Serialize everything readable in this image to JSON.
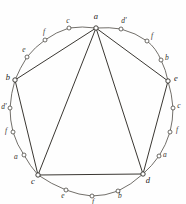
{
  "figure": {
    "type": "geometric-diagram",
    "width": 186,
    "height": 204,
    "background_color": "#fefefe",
    "ink_color": "#3a3732",
    "arc_color": "#59554f",
    "vertices": [
      {
        "id": "v-a",
        "label": "a",
        "x": 96,
        "y": 28,
        "label_x": 96,
        "label_y": 16
      },
      {
        "id": "v-e",
        "label": "e",
        "x": 168,
        "y": 81,
        "label_x": 176,
        "label_y": 78
      },
      {
        "id": "v-d",
        "label": "d",
        "x": 143,
        "y": 174,
        "label_x": 148,
        "label_y": 180
      },
      {
        "id": "v-c",
        "label": "c",
        "x": 38,
        "y": 175,
        "label_x": 33,
        "label_y": 181
      },
      {
        "id": "v-b",
        "label": "b",
        "x": 15,
        "y": 80,
        "label_x": 8,
        "label_y": 77
      }
    ],
    "arc_points": [
      {
        "id": "p-1",
        "label": "d'",
        "x": 121,
        "y": 29,
        "label_x": 124,
        "label_y": 21
      },
      {
        "id": "p-2",
        "label": "f",
        "x": 147,
        "y": 41,
        "label_x": 152,
        "label_y": 36
      },
      {
        "id": "p-3",
        "label": "b",
        "x": 161,
        "y": 60,
        "label_x": 167,
        "label_y": 58
      },
      {
        "id": "p-4",
        "label": "c",
        "x": 173,
        "y": 108,
        "label_x": 179,
        "label_y": 106
      },
      {
        "id": "p-5",
        "label": "f",
        "x": 170,
        "y": 132,
        "label_x": 177,
        "label_y": 130
      },
      {
        "id": "p-6",
        "label": "a",
        "x": 159,
        "y": 156,
        "label_x": 165,
        "label_y": 155
      },
      {
        "id": "p-7",
        "label": "b",
        "x": 118,
        "y": 191,
        "label_x": 120,
        "label_y": 196
      },
      {
        "id": "p-8",
        "label": "f",
        "x": 92,
        "y": 196,
        "label_x": 93,
        "label_y": 202
      },
      {
        "id": "p-9",
        "label": "e",
        "x": 66,
        "y": 190,
        "label_x": 63,
        "label_y": 196
      },
      {
        "id": "p-10",
        "label": "a",
        "x": 24,
        "y": 155,
        "label_x": 16,
        "label_y": 157
      },
      {
        "id": "p-11",
        "label": "f",
        "x": 13,
        "y": 132,
        "label_x": 6,
        "label_y": 131
      },
      {
        "id": "p-12",
        "label": "d'",
        "x": 10,
        "y": 108,
        "label_x": 4,
        "label_y": 107
      },
      {
        "id": "p-13",
        "label": "e",
        "x": 27,
        "y": 57,
        "label_x": 24,
        "label_y": 50
      },
      {
        "id": "p-14",
        "label": "f",
        "x": 45,
        "y": 40,
        "label_x": 44,
        "label_y": 32
      },
      {
        "id": "p-15",
        "label": "c",
        "x": 69,
        "y": 28,
        "label_x": 68,
        "label_y": 21
      }
    ],
    "arc_segments": [
      {
        "id": "arc-a-to-e",
        "d": "M 96,28 Q 110,27 121,29 Q 136,33 147,41 Q 156,48 161,60 Q 166,70 168,81"
      },
      {
        "id": "arc-e-to-d",
        "d": "M 168,81 Q 172,94 173,108 Q 173,120 170,132 Q 166,145 159,156 Q 152,166 143,174"
      },
      {
        "id": "arc-d-to-c",
        "d": "M 143,174 Q 131,185 118,191 Q 105,196 92,196 Q 79,195 66,190 Q 51,184 38,175"
      },
      {
        "id": "arc-c-to-b",
        "d": "M 38,175 Q 30,166 24,155 Q 17,145 13,132 Q 10,120 10,108 Q 11,93 15,80"
      },
      {
        "id": "arc-b-to-a",
        "d": "M 15,80 Q 20,68 27,57 Q 35,47 45,40 Q 56,32 69,28 Q 82,26 96,28"
      }
    ],
    "chords": [
      {
        "id": "chord-a-e",
        "x1": 96,
        "y1": 28,
        "x2": 168,
        "y2": 81
      },
      {
        "id": "chord-e-d",
        "x1": 168,
        "y1": 81,
        "x2": 143,
        "y2": 174
      },
      {
        "id": "chord-d-c",
        "x1": 143,
        "y1": 174,
        "x2": 38,
        "y2": 175
      },
      {
        "id": "chord-c-b",
        "x1": 38,
        "y1": 175,
        "x2": 15,
        "y2": 80
      },
      {
        "id": "chord-b-a",
        "x1": 15,
        "y1": 80,
        "x2": 96,
        "y2": 28
      }
    ],
    "diagonals": [
      {
        "id": "diag-a-c",
        "x1": 96,
        "y1": 28,
        "x2": 38,
        "y2": 175
      },
      {
        "id": "diag-a-d",
        "x1": 96,
        "y1": 28,
        "x2": 143,
        "y2": 174
      }
    ]
  },
  "chart_data": {
    "type": "scatter",
    "xlabel": "",
    "ylabel": "",
    "grid": false,
    "legend": "none",
    "xlim": [
      0,
      186
    ],
    "ylim": [
      0,
      204
    ],
    "series": [
      {
        "name": "pentagon-vertices",
        "labels": [
          "a",
          "e",
          "d",
          "c",
          "b"
        ],
        "x": [
          96,
          168,
          143,
          38,
          15
        ],
        "y": [
          28,
          81,
          174,
          175,
          80
        ]
      },
      {
        "name": "arc-points",
        "labels": [
          "d'",
          "f",
          "b",
          "c",
          "f",
          "a",
          "b",
          "f",
          "e",
          "a",
          "f",
          "d'",
          "e",
          "f",
          "c"
        ],
        "x": [
          121,
          147,
          161,
          173,
          170,
          159,
          118,
          92,
          66,
          24,
          13,
          10,
          27,
          45,
          69
        ],
        "y": [
          29,
          41,
          60,
          108,
          132,
          156,
          191,
          196,
          190,
          155,
          132,
          108,
          57,
          40,
          28
        ]
      }
    ]
  }
}
